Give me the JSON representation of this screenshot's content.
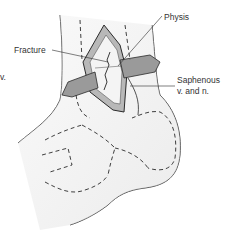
{
  "figure": {
    "type": "medical-illustration",
    "labels": {
      "fracture": "Fracture",
      "physis": "Physis",
      "saphenous_line1": "Saphenous",
      "saphenous_line2": "v. and n.",
      "partial_left": "v."
    },
    "colors": {
      "background": "#ffffff",
      "skin_fill": "#f0f0f0",
      "skin_shadow": "#d8d8d8",
      "outline": "#2a2a2a",
      "incision_fill": "#b0b0b0",
      "vessel_fill": "#9a9a9a",
      "text": "#333333"
    }
  }
}
